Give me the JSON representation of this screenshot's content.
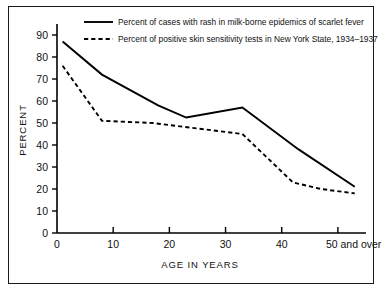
{
  "chart_data": {
    "type": "line",
    "title": "",
    "xlabel": "AGE IN YEARS",
    "ylabel": "PERCENT",
    "xlim": [
      0,
      55
    ],
    "ylim": [
      0,
      95
    ],
    "grid": false,
    "legend_position": "top-right-inside",
    "x_ticks": [
      {
        "value": 0,
        "label": "0"
      },
      {
        "value": 10,
        "label": "10"
      },
      {
        "value": 20,
        "label": "20"
      },
      {
        "value": 30,
        "label": "30"
      },
      {
        "value": 40,
        "label": "40"
      },
      {
        "value": 50,
        "label": "50 and over"
      }
    ],
    "y_ticks": [
      {
        "value": 0,
        "label": "0"
      },
      {
        "value": 10,
        "label": "10"
      },
      {
        "value": 20,
        "label": "20"
      },
      {
        "value": 30,
        "label": "30"
      },
      {
        "value": 40,
        "label": "40"
      },
      {
        "value": 50,
        "label": "50"
      },
      {
        "value": 60,
        "label": "60"
      },
      {
        "value": 70,
        "label": "70"
      },
      {
        "value": 80,
        "label": "80"
      },
      {
        "value": 90,
        "label": "90"
      }
    ],
    "series": [
      {
        "name": "Percent of cases with rash in milk-borne epidemics of scarlet fever",
        "style": "solid",
        "color": "#000000",
        "x": [
          1,
          8,
          18,
          23,
          33,
          43,
          53
        ],
        "values": [
          87,
          72,
          58,
          52.5,
          57,
          38,
          21
        ]
      },
      {
        "name": "Percent of positive skin sensitivity tests in New York State, 1934-1937",
        "style": "dashed",
        "color": "#000000",
        "x": [
          1,
          8,
          17,
          33,
          42,
          47,
          53
        ],
        "values": [
          76,
          51,
          50,
          45,
          23,
          20,
          18
        ]
      }
    ]
  },
  "legend": {
    "entries": [
      {
        "label": "Percent of cases with rash in milk-borne epidemics of scarlet fever",
        "style": "solid"
      },
      {
        "label": "Percent of positive skin sensitivity tests in New York State, 1934–1937",
        "style": "dashed"
      }
    ]
  },
  "axes": {
    "y_title": "PERCENT",
    "x_title": "AGE IN YEARS"
  }
}
